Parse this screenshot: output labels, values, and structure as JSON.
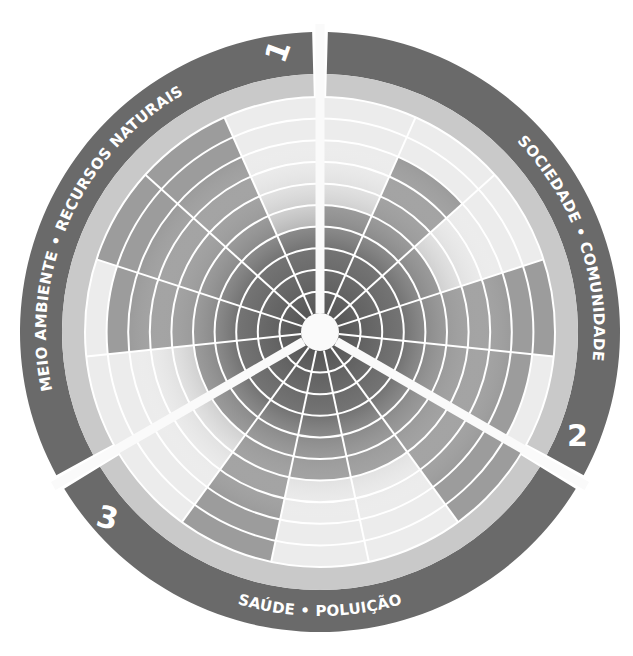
{
  "diagram": {
    "type": "radial-wheel",
    "center": [
      320,
      332
    ],
    "rings": 10,
    "colors": {
      "band": "#6a6a6a",
      "label_ring": "#c9c9c9",
      "filled": "#9c9c9c",
      "empty": "#ececec",
      "center_dark": "#5a5a5a",
      "grid": "#ffffff"
    },
    "sectors": [
      {
        "number": "1",
        "title": "MEIO AMBIENTE • RECURSOS NATURAIS",
        "levels": [
          5,
          9,
          10,
          10,
          4
        ]
      },
      {
        "number": "2",
        "title": "SOCIEDADE • COMUNIDADE",
        "levels": [
          5,
          8,
          5,
          10,
          9
        ]
      },
      {
        "number": "3",
        "title": "SAÚDE • POLUIÇÃO",
        "levels": [
          10,
          6,
          6,
          10,
          5
        ]
      }
    ]
  }
}
